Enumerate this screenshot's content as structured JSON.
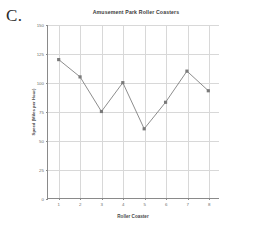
{
  "page": {
    "label": "C."
  },
  "chart_data": {
    "type": "line",
    "title": "Amusement Park Roller Coasters",
    "xlabel": "Roller Coaster",
    "ylabel": "Speed (Miles per Hour)",
    "categories": [
      "1",
      "2",
      "3",
      "4",
      "5",
      "6",
      "7",
      "8"
    ],
    "values": [
      120,
      105,
      75,
      100,
      60,
      83,
      110,
      93
    ],
    "x": [
      1,
      2,
      3,
      4,
      5,
      6,
      7,
      8
    ],
    "ylim": [
      0,
      150
    ],
    "yticks": [
      0,
      25,
      50,
      75,
      100,
      125,
      150
    ],
    "xlim": [
      0.5,
      8.5
    ],
    "grid": true,
    "legend": false,
    "series_color": "#808080",
    "marker": "square",
    "marker_color": "#7a7a7a",
    "gridline_color": "#d8d8d8",
    "axis_color": "#8a8a8a",
    "background": "#ffffff"
  }
}
